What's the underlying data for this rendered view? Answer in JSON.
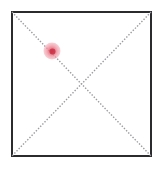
{
  "canvas": {
    "width": 163,
    "height": 169,
    "background_color": "#ffffff"
  },
  "region_box": {
    "label": "region-bounding-box",
    "border_color": "#2b2b2e",
    "border_width_px": 2,
    "fill_color": "#ffffff",
    "left_px": 11,
    "top_px": 11,
    "width_px": 141,
    "height_px": 146
  },
  "diagonals": {
    "style": "dotted",
    "dot_color": "#9a9a9f",
    "dot_size_px": 1.4,
    "dot_spacing_px": 3.1,
    "intersection_x": 81.5,
    "intersection_y": 84,
    "lines": [
      {
        "name": "diagonal-top-left-to-bottom-right",
        "x1": 12,
        "y1": 12,
        "x2": 151,
        "y2": 156
      },
      {
        "name": "diagonal-top-right-to-bottom-left",
        "x1": 151,
        "y1": 12,
        "x2": 12,
        "y2": 156
      }
    ]
  },
  "marker": {
    "name": "highlight-marker",
    "shape": "circle",
    "center_x": 52,
    "center_y": 51,
    "diameter_px": 17,
    "fill_color": "#f2a0a8",
    "core_color": "#d63c4e",
    "opacity": 0.8,
    "on_line": "diagonal-top-left-to-bottom-right",
    "position_along_line_pct": 29
  }
}
